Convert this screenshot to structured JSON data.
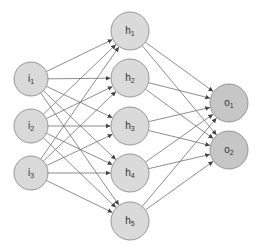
{
  "diagram": {
    "type": "feedforward-neural-network",
    "colors": {
      "background": "#ffffff",
      "input_fill": "#d9d9d9",
      "hidden_fill": "#dadada",
      "output_fill": "#c6c6c6",
      "node_stroke": "#8c8c8c",
      "edge": "#707070",
      "arrowhead": "#444444",
      "label": "#333333"
    },
    "layers": [
      {
        "name": "input",
        "x": 31,
        "radius": 17,
        "nodes": [
          {
            "id": "i1",
            "base": "i",
            "sub": "1",
            "y": 79
          },
          {
            "id": "i2",
            "base": "i",
            "sub": "2",
            "y": 126
          },
          {
            "id": "i3",
            "base": "i",
            "sub": "3",
            "y": 173
          }
        ]
      },
      {
        "name": "hidden",
        "x": 130,
        "radius": 19,
        "nodes": [
          {
            "id": "h1",
            "base": "h",
            "sub": "1",
            "y": 31
          },
          {
            "id": "h2",
            "base": "h",
            "sub": "2",
            "y": 78
          },
          {
            "id": "h3",
            "base": "h",
            "sub": "3",
            "y": 126
          },
          {
            "id": "h4",
            "base": "h",
            "sub": "4",
            "y": 173
          },
          {
            "id": "h5",
            "base": "h",
            "sub": "5",
            "y": 221
          }
        ]
      },
      {
        "name": "output",
        "x": 229,
        "radius": 19,
        "nodes": [
          {
            "id": "o1",
            "base": "o",
            "sub": "1",
            "y": 103
          },
          {
            "id": "o2",
            "base": "o",
            "sub": "2",
            "y": 150
          }
        ]
      }
    ],
    "connectivity": "fully-connected",
    "edge_directed": true
  }
}
